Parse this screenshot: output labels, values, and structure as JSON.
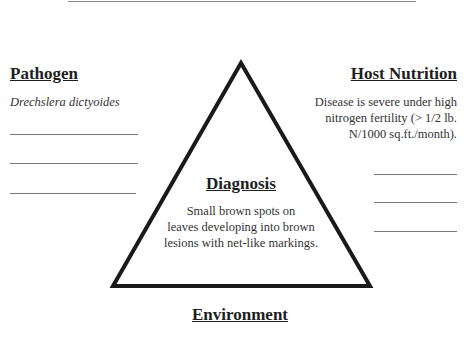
{
  "pathogen": {
    "heading": "Pathogen",
    "value": "Drechslera dictyoides"
  },
  "host_nutrition": {
    "heading": "Host Nutrition",
    "lines": [
      "Disease is severe under high",
      "nitrogen fertility (> 1/2 lb.",
      "N/1000 sq.ft./month)."
    ]
  },
  "diagnosis": {
    "heading": "Diagnosis",
    "lines": [
      "Small brown spots on",
      "leaves developing into brown",
      "lesions with net-like markings."
    ]
  },
  "environment": {
    "heading": "Environment"
  }
}
